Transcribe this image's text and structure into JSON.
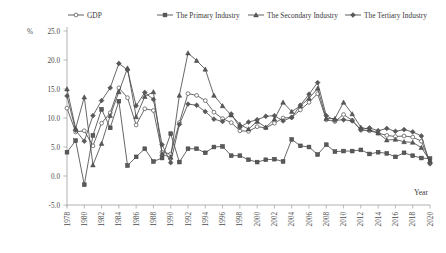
{
  "chart_data": {
    "type": "line",
    "title": "",
    "xlabel": "Year",
    "ylabel": "%",
    "ylim": [
      -5.0,
      25.0
    ],
    "xlim": [
      1978,
      2020
    ],
    "grid": false,
    "legend_position": "top",
    "ytick_labels": [
      "25.0",
      "20.0",
      "15.0",
      "10.0",
      "5.0",
      "0.0",
      "-5.0"
    ],
    "ytick_values": [
      25.0,
      20.0,
      15.0,
      10.0,
      5.0,
      0.0,
      -5.0
    ],
    "xtick_labels": [
      "1978",
      "1980",
      "1982",
      "1984",
      "1986",
      "1988",
      "1990",
      "1992",
      "1994",
      "1996",
      "1998",
      "2000",
      "2002",
      "2004",
      "2006",
      "2008",
      "2010",
      "2012",
      "2014",
      "2016",
      "2018",
      "2020"
    ],
    "x": [
      1978,
      1979,
      1980,
      1981,
      1982,
      1983,
      1984,
      1985,
      1986,
      1987,
      1988,
      1989,
      1990,
      1991,
      1992,
      1993,
      1994,
      1995,
      1996,
      1997,
      1998,
      1999,
      2000,
      2001,
      2002,
      2003,
      2004,
      2005,
      2006,
      2007,
      2008,
      2009,
      2010,
      2011,
      2012,
      2013,
      2014,
      2015,
      2016,
      2017,
      2018,
      2019,
      2020
    ],
    "series": [
      {
        "name": "GDP",
        "marker": "circle",
        "values": [
          11.7,
          7.6,
          7.8,
          5.2,
          9.1,
          10.9,
          15.2,
          13.5,
          8.8,
          11.6,
          11.3,
          4.1,
          3.8,
          9.2,
          14.2,
          13.9,
          13.0,
          11.0,
          9.9,
          9.2,
          7.8,
          7.7,
          8.5,
          8.3,
          9.1,
          10.0,
          10.1,
          11.4,
          12.7,
          14.2,
          9.7,
          9.4,
          10.6,
          9.6,
          7.9,
          7.8,
          7.4,
          7.0,
          6.8,
          6.9,
          6.7,
          6.0,
          2.3
        ]
      },
      {
        "name": "The Primary Industry",
        "marker": "square",
        "values": [
          4.1,
          6.1,
          -1.5,
          7.0,
          11.5,
          8.3,
          12.9,
          1.8,
          3.3,
          4.7,
          2.5,
          3.1,
          7.3,
          2.4,
          4.7,
          4.7,
          4.0,
          5.0,
          5.1,
          3.5,
          3.5,
          2.8,
          2.4,
          2.8,
          2.9,
          2.5,
          6.3,
          5.2,
          5.0,
          3.7,
          5.4,
          4.2,
          4.3,
          4.3,
          4.5,
          3.8,
          4.1,
          3.9,
          3.3,
          4.0,
          3.5,
          3.1,
          3.0
        ]
      },
      {
        "name": "The Secondary Industry",
        "marker": "triangle",
        "values": [
          15.0,
          8.2,
          13.6,
          1.9,
          5.6,
          10.4,
          14.5,
          18.6,
          10.2,
          13.7,
          14.5,
          3.8,
          3.2,
          13.9,
          21.2,
          19.9,
          18.4,
          13.9,
          12.1,
          10.5,
          8.9,
          8.1,
          9.4,
          8.4,
          9.8,
          12.7,
          11.1,
          12.1,
          13.4,
          15.1,
          9.9,
          9.9,
          12.7,
          10.7,
          8.4,
          8.0,
          7.4,
          6.2,
          6.3,
          5.9,
          5.8,
          4.9,
          2.6
        ]
      },
      {
        "name": "The Tertiary Industry",
        "marker": "diamond",
        "values": [
          13.8,
          7.9,
          6.0,
          10.4,
          13.0,
          15.2,
          19.4,
          18.3,
          12.1,
          14.4,
          13.2,
          5.4,
          2.3,
          8.9,
          12.4,
          12.2,
          11.1,
          9.8,
          9.4,
          10.7,
          8.4,
          9.3,
          9.7,
          10.3,
          10.4,
          9.5,
          10.1,
          12.2,
          14.1,
          16.1,
          10.4,
          9.6,
          9.7,
          9.5,
          8.0,
          8.3,
          7.8,
          8.2,
          7.7,
          8.0,
          7.6,
          6.9,
          2.1
        ]
      }
    ]
  },
  "legend": {
    "items": [
      {
        "label": "GDP",
        "marker": "circle"
      },
      {
        "label": "The Primary Industry",
        "marker": "square"
      },
      {
        "label": "The Secondary Industry",
        "marker": "triangle"
      },
      {
        "label": "The Tertiary Industry",
        "marker": "diamond"
      }
    ]
  },
  "axis": {
    "y_unit": "%",
    "x_title": "Year"
  }
}
